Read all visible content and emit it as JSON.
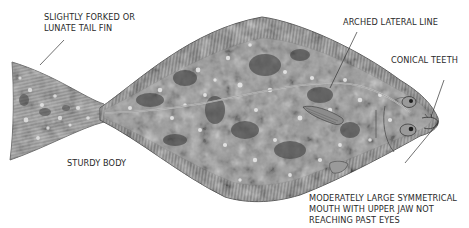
{
  "diagram": {
    "colors": {
      "background": "#ffffff",
      "fish_base": "#9a9a9a",
      "fish_dark_blotch": "#3e3e3e",
      "fish_light_spot": "#e4e4e4",
      "fin_ray": "#6a6a6a",
      "outline": "#4a4a4a",
      "leader_line": "#333333",
      "label_text": "#2a2a2a"
    },
    "labels": [
      {
        "id": "tail",
        "lines": [
          "SLIGHTLY FORKED OR",
          "LUNATE TAIL FIN"
        ]
      },
      {
        "id": "lateral-line",
        "lines": [
          "ARCHED LATERAL LINE"
        ]
      },
      {
        "id": "teeth",
        "lines": [
          "CONICAL TEETH"
        ]
      },
      {
        "id": "body",
        "lines": [
          "STURDY BODY"
        ]
      },
      {
        "id": "mouth",
        "lines": [
          "MODERATELY LARGE SYMMETRICAL",
          "MOUTH WITH UPPER JAW NOT",
          "REACHING PAST EYES"
        ]
      }
    ]
  }
}
